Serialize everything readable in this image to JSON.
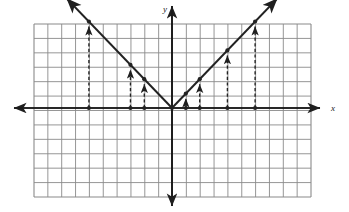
{
  "figure": {
    "kind": "coordinate-grid-graph",
    "background": "#ffffff",
    "ink_color": "#222222",
    "grid_color": "#8a8a8a",
    "axis_color": "#1a1a1a",
    "axis_labels": {
      "x": "x",
      "y": "y"
    }
  },
  "chart_data": {
    "type": "line",
    "title": "",
    "xlabel": "x",
    "ylabel": "y",
    "grid": true,
    "legend": "none",
    "xlim": [
      -10,
      10
    ],
    "ylim": [
      -6,
      6
    ],
    "x_tick_step": 1,
    "y_tick_step": 1,
    "tick_labels_shown": false,
    "series": [
      {
        "name": "y = |x|",
        "kind": "v-shape-absolute-value",
        "vertex": [
          0,
          0
        ],
        "left_slope": -1,
        "right_slope": 1,
        "x": [
          -7,
          0,
          7
        ],
        "values": [
          7,
          0,
          7
        ],
        "arrow_both_ends": true
      }
    ],
    "annotations": {
      "description": "Vertical dashed arrows drawn from points on the x-axis up to the V-shaped graph",
      "dashed_arrows": [
        {
          "x": -6,
          "y_from": 0,
          "y_to": 6
        },
        {
          "x": -3,
          "y_from": 0,
          "y_to": 3
        },
        {
          "x": -2,
          "y_from": 0,
          "y_to": 2
        },
        {
          "x": 1,
          "y_from": 0,
          "y_to": 1
        },
        {
          "x": 2,
          "y_from": 0,
          "y_to": 2
        },
        {
          "x": 4,
          "y_from": 0,
          "y_to": 4
        },
        {
          "x": 6,
          "y_from": 0,
          "y_to": 6
        }
      ],
      "axis_dots": [
        -6,
        -3,
        -2,
        1,
        2,
        4,
        6
      ],
      "vertex_dot": [
        0,
        0
      ]
    }
  },
  "geometry": {
    "grid_left": 34,
    "grid_top": 24,
    "grid_right": 311,
    "grid_bottom": 197,
    "cols": 20,
    "rows": 12,
    "origin_x": 172,
    "origin_y": 108,
    "cell_w": 13.85,
    "cell_h": 14.4
  }
}
